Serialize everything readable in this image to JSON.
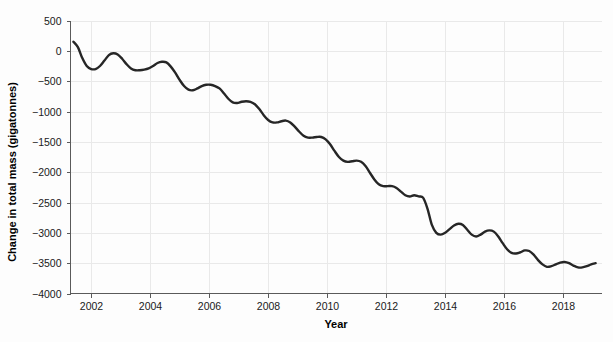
{
  "chart_data": {
    "type": "line",
    "title": "",
    "xlabel": "Year",
    "ylabel": "Change in total mass (gigatonnes)",
    "xlim": [
      2001.3,
      2019.3
    ],
    "ylim": [
      -4000,
      500
    ],
    "grid": true,
    "legend": "none",
    "line_color": "#262626",
    "background_color": "#fdfdfd",
    "grid_color": "#e9e9e9",
    "axis_color": "#5a5a5a",
    "xticks": [
      2002,
      2004,
      2006,
      2008,
      2010,
      2012,
      2014,
      2016,
      2018
    ],
    "xtick_labels": [
      "2002",
      "2004",
      "2006",
      "2008",
      "2010",
      "2012",
      "2014",
      "2016",
      "2018"
    ],
    "yticks": [
      500,
      0,
      -500,
      -1000,
      -1500,
      -2000,
      -2500,
      -3000,
      -3500,
      -4000
    ],
    "ytick_labels": [
      "500",
      "0",
      "−500",
      "−1000",
      "−1500",
      "−2000",
      "−2500",
      "−3000",
      "−3500",
      "−4000"
    ],
    "series": [
      {
        "name": "Change in total mass",
        "x": [
          2001.4,
          2001.55,
          2001.7,
          2001.85,
          2002.0,
          2002.15,
          2002.3,
          2002.45,
          2002.6,
          2002.75,
          2002.9,
          2003.05,
          2003.2,
          2003.35,
          2003.5,
          2003.65,
          2003.8,
          2003.95,
          2004.1,
          2004.25,
          2004.4,
          2004.55,
          2004.7,
          2004.85,
          2005.0,
          2005.15,
          2005.3,
          2005.45,
          2005.6,
          2005.75,
          2005.9,
          2006.05,
          2006.2,
          2006.35,
          2006.5,
          2006.65,
          2006.8,
          2006.95,
          2007.1,
          2007.25,
          2007.4,
          2007.55,
          2007.7,
          2007.85,
          2008.0,
          2008.15,
          2008.3,
          2008.45,
          2008.6,
          2008.75,
          2008.9,
          2009.05,
          2009.2,
          2009.35,
          2009.5,
          2009.65,
          2009.8,
          2009.95,
          2010.1,
          2010.25,
          2010.4,
          2010.55,
          2010.7,
          2010.85,
          2011.0,
          2011.15,
          2011.3,
          2011.45,
          2011.6,
          2011.75,
          2011.9,
          2012.05,
          2012.2,
          2012.35,
          2012.5,
          2012.65,
          2012.8,
          2012.95,
          2013.1,
          2013.25,
          2013.4,
          2013.55,
          2013.7,
          2013.85,
          2014.0,
          2014.15,
          2014.3,
          2014.45,
          2014.6,
          2014.75,
          2014.9,
          2015.05,
          2015.2,
          2015.35,
          2015.5,
          2015.65,
          2015.8,
          2015.95,
          2016.1,
          2016.25,
          2016.4,
          2016.55,
          2016.7,
          2016.85,
          2017.0,
          2017.15,
          2017.3,
          2017.45,
          2017.6,
          2017.75,
          2017.9,
          2018.05,
          2018.2,
          2018.35,
          2018.5,
          2018.65,
          2018.8,
          2018.95,
          2019.1
        ],
        "y": [
          150,
          60,
          -120,
          -250,
          -300,
          -300,
          -250,
          -160,
          -70,
          -40,
          -60,
          -130,
          -220,
          -290,
          -320,
          -320,
          -310,
          -290,
          -250,
          -200,
          -180,
          -190,
          -260,
          -360,
          -480,
          -580,
          -640,
          -650,
          -620,
          -580,
          -560,
          -560,
          -580,
          -620,
          -700,
          -790,
          -850,
          -860,
          -840,
          -830,
          -840,
          -880,
          -960,
          -1060,
          -1140,
          -1180,
          -1180,
          -1160,
          -1150,
          -1180,
          -1250,
          -1330,
          -1400,
          -1430,
          -1430,
          -1420,
          -1420,
          -1460,
          -1540,
          -1650,
          -1750,
          -1810,
          -1830,
          -1820,
          -1810,
          -1830,
          -1900,
          -2010,
          -2120,
          -2200,
          -2230,
          -2230,
          -2230,
          -2260,
          -2320,
          -2380,
          -2400,
          -2380,
          -2400,
          -2420,
          -2600,
          -2870,
          -3000,
          -3030,
          -3000,
          -2940,
          -2880,
          -2850,
          -2870,
          -2950,
          -3030,
          -3060,
          -3030,
          -2980,
          -2960,
          -2980,
          -3060,
          -3170,
          -3270,
          -3330,
          -3340,
          -3320,
          -3290,
          -3300,
          -3360,
          -3450,
          -3520,
          -3560,
          -3550,
          -3520,
          -3490,
          -3480,
          -3500,
          -3540,
          -3570,
          -3570,
          -3550,
          -3520,
          -3500
        ]
      }
    ]
  }
}
